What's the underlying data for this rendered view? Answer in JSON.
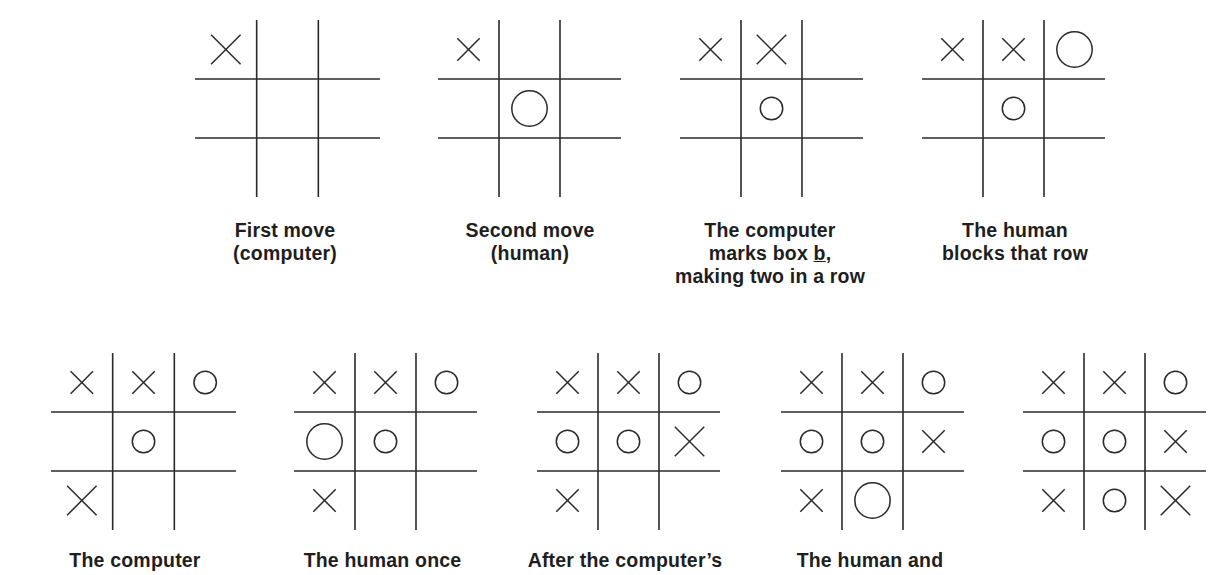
{
  "figure": {
    "rows": [
      {
        "boards": [
          {
            "id": "b1",
            "box": {
              "x": 195,
              "y": 20,
              "w": 185,
              "h": 177
            },
            "cells": [
              "X",
              "",
              "",
              "",
              "",
              "",
              "",
              "",
              ""
            ],
            "sizes": [
              "m",
              "",
              "",
              "",
              "",
              "",
              "",
              "",
              ""
            ],
            "caption_lines": [
              "First move",
              "(computer)"
            ],
            "caption_pos": {
              "x": 170,
              "y": 219,
              "w": 230
            }
          },
          {
            "id": "b2",
            "box": {
              "x": 438,
              "y": 20,
              "w": 183,
              "h": 177
            },
            "cells": [
              "X",
              "",
              "",
              "",
              "O",
              "",
              "",
              "",
              ""
            ],
            "sizes": [
              "s",
              "",
              "",
              "",
              "l",
              "",
              "",
              "",
              ""
            ],
            "caption_lines": [
              "Second move",
              "(human)"
            ],
            "caption_pos": {
              "x": 415,
              "y": 219,
              "w": 230
            }
          },
          {
            "id": "b3",
            "box": {
              "x": 680,
              "y": 20,
              "w": 183,
              "h": 177
            },
            "cells": [
              "X",
              "X",
              "",
              "",
              "O",
              "",
              "",
              "",
              ""
            ],
            "sizes": [
              "s",
              "m",
              "",
              "",
              "s",
              "",
              "",
              "",
              ""
            ],
            "caption_lines": [
              "The computer",
              "marks box b,",
              "making two in a row"
            ],
            "caption_underline": {
              "line": 1,
              "text": "b"
            },
            "caption_pos": {
              "x": 645,
              "y": 219,
              "w": 250
            }
          },
          {
            "id": "b4",
            "box": {
              "x": 922,
              "y": 20,
              "w": 183,
              "h": 177
            },
            "cells": [
              "X",
              "X",
              "O",
              "",
              "O",
              "",
              "",
              "",
              ""
            ],
            "sizes": [
              "s",
              "s",
              "l",
              "",
              "s",
              "",
              "",
              "",
              ""
            ],
            "caption_lines": [
              "The human",
              "blocks that row"
            ],
            "caption_pos": {
              "x": 895,
              "y": 219,
              "w": 240
            }
          }
        ]
      },
      {
        "boards": [
          {
            "id": "b5",
            "box": {
              "x": 51,
              "y": 353,
              "w": 185,
              "h": 177
            },
            "cells": [
              "X",
              "X",
              "O",
              "",
              "O",
              "",
              "X",
              "",
              ""
            ],
            "sizes": [
              "s",
              "s",
              "s",
              "",
              "s",
              "",
              "m",
              "",
              ""
            ],
            "caption_lines": [
              "The computer"
            ],
            "caption_pos": {
              "x": 20,
              "y": 549,
              "w": 230
            }
          },
          {
            "id": "b6",
            "box": {
              "x": 294,
              "y": 353,
              "w": 183,
              "h": 177
            },
            "cells": [
              "X",
              "X",
              "O",
              "O",
              "O",
              "",
              "X",
              "",
              ""
            ],
            "sizes": [
              "s",
              "s",
              "s",
              "l",
              "s",
              "",
              "s",
              "",
              ""
            ],
            "caption_lines": [
              "The human once"
            ],
            "caption_pos": {
              "x": 260,
              "y": 549,
              "w": 245
            }
          },
          {
            "id": "b7",
            "box": {
              "x": 537,
              "y": 353,
              "w": 183,
              "h": 177
            },
            "cells": [
              "X",
              "X",
              "O",
              "O",
              "O",
              "X",
              "X",
              "",
              ""
            ],
            "sizes": [
              "s",
              "s",
              "s",
              "s",
              "s",
              "m",
              "s",
              "",
              ""
            ],
            "caption_lines": [
              "After the computer’s"
            ],
            "caption_pos": {
              "x": 500,
              "y": 549,
              "w": 250
            }
          },
          {
            "id": "b8",
            "box": {
              "x": 781,
              "y": 353,
              "w": 183,
              "h": 177
            },
            "cells": [
              "X",
              "X",
              "O",
              "O",
              "O",
              "X",
              "X",
              "O",
              ""
            ],
            "sizes": [
              "s",
              "s",
              "s",
              "s",
              "s",
              "s",
              "s",
              "l",
              ""
            ],
            "caption_lines": [
              "The human and"
            ],
            "caption_pos": {
              "x": 745,
              "y": 549,
              "w": 250
            }
          },
          {
            "id": "b9",
            "box": {
              "x": 1023,
              "y": 353,
              "w": 183,
              "h": 177
            },
            "cells": [
              "X",
              "X",
              "O",
              "O",
              "O",
              "X",
              "X",
              "O",
              "X"
            ],
            "sizes": [
              "s",
              "s",
              "s",
              "s",
              "s",
              "s",
              "s",
              "s",
              "m"
            ],
            "caption_lines": [],
            "caption_pos": {
              "x": 1000,
              "y": 549,
              "w": 230
            }
          }
        ]
      }
    ],
    "style": {
      "line_color": "#2a2a2a",
      "mark_color": "#2a2a2a",
      "background": "#ffffff"
    }
  }
}
